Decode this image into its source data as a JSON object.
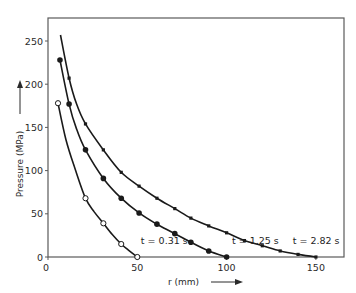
{
  "chart_data": {
    "type": "line",
    "title": "",
    "xlabel": "r (mm)",
    "ylabel": "Pressure (MPa)",
    "xlim": [
      0,
      165
    ],
    "ylim": [
      0,
      270
    ],
    "x_ticks": [
      0,
      50,
      100,
      150
    ],
    "y_ticks": [
      0,
      50,
      100,
      150,
      200,
      250
    ],
    "grid": false,
    "legend": "none (inline curve annotations)",
    "series": [
      {
        "name": "t = 0.31 s",
        "marker": "open-circle",
        "label": "t = 0.31 s",
        "label_pos": [
          52,
          15
        ],
        "curve": [
          [
            5.6,
            178
          ],
          [
            10,
            136
          ],
          [
            15,
            103
          ],
          [
            21,
            68
          ],
          [
            26,
            52
          ],
          [
            31,
            39
          ],
          [
            36,
            26
          ],
          [
            41,
            15
          ],
          [
            45,
            8
          ],
          [
            50,
            0
          ]
        ],
        "points": [
          [
            5.6,
            178
          ],
          [
            21,
            68
          ],
          [
            31,
            39
          ],
          [
            41,
            15
          ],
          [
            50,
            0
          ]
        ]
      },
      {
        "name": "t = 1.25 s",
        "marker": "filled-circle",
        "label": "t = 1.25 s",
        "label_pos": [
          103,
          15
        ],
        "curve": [
          [
            6.7,
            228
          ],
          [
            11.8,
            177
          ],
          [
            16,
            148
          ],
          [
            21,
            124
          ],
          [
            31,
            91
          ],
          [
            41,
            68
          ],
          [
            51,
            51
          ],
          [
            61,
            38
          ],
          [
            71,
            27
          ],
          [
            80,
            17
          ],
          [
            90,
            7
          ],
          [
            100,
            0
          ]
        ],
        "points": [
          [
            6.7,
            228
          ],
          [
            11.8,
            177
          ],
          [
            21,
            124
          ],
          [
            31,
            91
          ],
          [
            41,
            68
          ],
          [
            51,
            51
          ],
          [
            61,
            38
          ],
          [
            71,
            27
          ],
          [
            80,
            17
          ],
          [
            90,
            7
          ],
          [
            100,
            0
          ]
        ]
      },
      {
        "name": "t = 2.82 s",
        "marker": "small-square",
        "label": "t = 2.82 s",
        "label_pos": [
          137,
          15
        ],
        "curve": [
          [
            7,
            257
          ],
          [
            11.8,
            207
          ],
          [
            16,
            177
          ],
          [
            21,
            154
          ],
          [
            31,
            124
          ],
          [
            41,
            98
          ],
          [
            51,
            82
          ],
          [
            61,
            68
          ],
          [
            71,
            56
          ],
          [
            80,
            45
          ],
          [
            90,
            36
          ],
          [
            100,
            28
          ],
          [
            110,
            19
          ],
          [
            120,
            13
          ],
          [
            130,
            7
          ],
          [
            140,
            3
          ],
          [
            150,
            0
          ]
        ],
        "points": [
          [
            11.8,
            207
          ],
          [
            21,
            154
          ],
          [
            31,
            124
          ],
          [
            41,
            98
          ],
          [
            51,
            82
          ],
          [
            61,
            68
          ],
          [
            71,
            56
          ],
          [
            80,
            45
          ],
          [
            90,
            36
          ],
          [
            100,
            28
          ],
          [
            110,
            19
          ],
          [
            120,
            13
          ],
          [
            130,
            7
          ],
          [
            140,
            3
          ],
          [
            150,
            0
          ]
        ]
      }
    ]
  },
  "axes": {
    "x_label": "r (mm)",
    "y_label": "Pressure (MPa)",
    "x_arrow": "arrow-right",
    "y_arrow": "arrow-up"
  },
  "colors": {
    "line": "#1a1a1a",
    "frame": "#5a5a5a",
    "text": "#2a2a2a",
    "background": "#ffffff"
  }
}
